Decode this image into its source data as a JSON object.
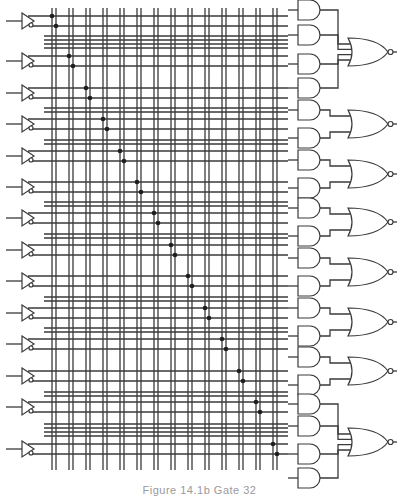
{
  "figure": {
    "caption": "Figure 14.1b  Gate 32",
    "colors": {
      "line": "#3a3a3a",
      "dot": "#1e1e1e",
      "background": "#ffffff",
      "caption": "#9a9a9a"
    }
  },
  "inputs": {
    "count": 14,
    "buffer_y": [
      21,
      61,
      93,
      124,
      156,
      187,
      218,
      250,
      281,
      313,
      344,
      376,
      407,
      449
    ],
    "component": "buffer-with-true-and-complement-outputs"
  },
  "bus": {
    "vertical_pairs_x": [
      [
        52,
        56
      ],
      [
        69,
        73
      ],
      [
        86,
        90
      ],
      [
        103,
        107
      ],
      [
        120,
        124
      ],
      [
        137,
        141
      ],
      [
        154,
        158
      ],
      [
        171,
        175
      ],
      [
        188,
        192
      ],
      [
        205,
        209
      ],
      [
        222,
        226
      ],
      [
        239,
        243
      ],
      [
        256,
        260
      ],
      [
        273,
        277
      ]
    ],
    "select_line_groups_y": [
      [
        36,
        40,
        44,
        48
      ],
      [
        108,
        112
      ],
      [
        140,
        144
      ],
      [
        202,
        206
      ],
      [
        234,
        238
      ],
      [
        297,
        301
      ],
      [
        328,
        332
      ],
      [
        392,
        396
      ],
      [
        424,
        428,
        432,
        436
      ]
    ]
  },
  "outputs": {
    "nor_gates": [
      {
        "y": 52,
        "and_inputs": [
          10,
          35,
          64,
          88
        ]
      },
      {
        "y": 124,
        "and_inputs": [
          110,
          138
        ]
      },
      {
        "y": 174,
        "and_inputs": [
          160,
          188
        ]
      },
      {
        "y": 222,
        "and_inputs": [
          208,
          236
        ]
      },
      {
        "y": 272,
        "and_inputs": [
          258,
          286
        ]
      },
      {
        "y": 322,
        "and_inputs": [
          308,
          336
        ]
      },
      {
        "y": 371,
        "and_inputs": [
          357,
          385
        ]
      },
      {
        "y": 442,
        "and_inputs": [
          404,
          426,
          454,
          478
        ]
      }
    ]
  }
}
